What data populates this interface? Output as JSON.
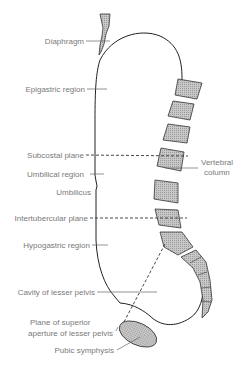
{
  "diagram": {
    "type": "anatomical-sagittal-section",
    "labels": {
      "diaphragm": "Diaphragm",
      "epigastric": "Epigastric region",
      "subcostal": "Subcostal plane",
      "umbilical_region": "Umbilical region",
      "umbilicus": "Umbilicus",
      "intertubercular": "Intertubercular plane",
      "hypogastric": "Hypogastric region",
      "cavity": "Cavity of lesser pelvis",
      "plane_line1": "Plane of superior",
      "plane_line2": "aperture of lesser pelvis",
      "pubic": "Pubic symphysis",
      "vertebral_line1": "Vertebral",
      "vertebral_line2": "column"
    }
  }
}
